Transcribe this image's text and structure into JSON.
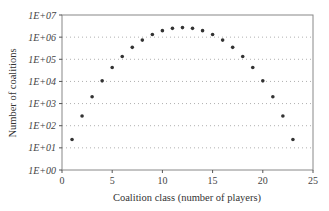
{
  "chart_data": {
    "type": "scatter",
    "title": "",
    "xlabel": "Coalition class (number of players)",
    "ylabel": "Number of coalitions",
    "xlim": [
      0,
      25
    ],
    "ylim": [
      1,
      10000000
    ],
    "yscale": "log",
    "x_ticks": [
      "0",
      "5",
      "10",
      "15",
      "20",
      "25"
    ],
    "x_tick_values": [
      0,
      5,
      10,
      15,
      20,
      25
    ],
    "y_ticks": [
      "1E+00",
      "1E+01",
      "1E+02",
      "1E+03",
      "1E+04",
      "1E+05",
      "1E+06",
      "1E+07"
    ],
    "grid": "horizontal dotted",
    "legend": "none",
    "series": [
      {
        "name": "Number of coalitions",
        "x": [
          1,
          2,
          3,
          4,
          5,
          6,
          7,
          8,
          9,
          10,
          11,
          12,
          13,
          14,
          15,
          16,
          17,
          18,
          19,
          20,
          21,
          22,
          23
        ],
        "values": [
          24,
          276,
          2024,
          10626,
          42504,
          134596,
          346104,
          735471,
          1307504,
          1961256,
          2496144,
          2704156,
          2496144,
          1961256,
          1307504,
          735471,
          346104,
          134596,
          42504,
          10626,
          2024,
          276,
          24
        ]
      }
    ]
  },
  "style": {
    "marker_color": "#333333",
    "grid_color": "#b0b0b0",
    "axis_color": "#555555"
  }
}
